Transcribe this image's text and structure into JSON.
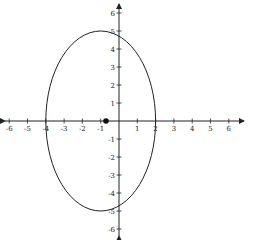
{
  "chart_data": {
    "type": "diagram",
    "title": "",
    "shape": "ellipse",
    "ellipse": {
      "center": [
        -1,
        0
      ],
      "semi_axis_x": 3,
      "semi_axis_y": 5
    },
    "point": {
      "x": -1,
      "y": 0,
      "label": "center"
    },
    "x_ticks": [
      "-6",
      "-5",
      "-4",
      "-3",
      "-2",
      "-1",
      "1",
      "2",
      "3",
      "4",
      "5",
      "6"
    ],
    "y_ticks": [
      "6",
      "5",
      "4",
      "3",
      "2",
      "1",
      "-1",
      "-2",
      "-3",
      "-4",
      "-5",
      "-6"
    ],
    "xlim": [
      -6.5,
      6.5
    ],
    "ylim": [
      -6.5,
      6.5
    ],
    "grid": false
  },
  "axes": {
    "x_labels": [
      "-6",
      "-5",
      "-4",
      "-3",
      "-2",
      "-1",
      "1",
      "2",
      "3",
      "4",
      "5",
      "6"
    ],
    "y_labels": [
      "6",
      "5",
      "4",
      "3",
      "2",
      "1",
      "-1",
      "-2",
      "-3",
      "-4",
      "-5",
      "-6"
    ]
  },
  "colors": {
    "ink": "#222222",
    "background": "#ffffff"
  }
}
